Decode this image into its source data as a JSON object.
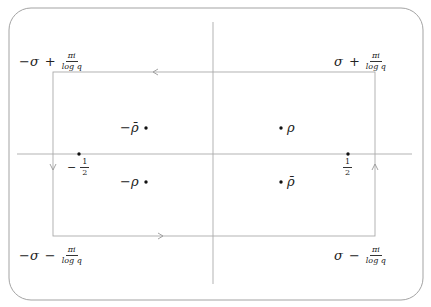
{
  "diagram": {
    "type": "contour-integral-rectangle",
    "colors": {
      "axis": "#aaaaaa",
      "contour": "#aaaaaa",
      "border": "#999999",
      "dot": "#111111",
      "text": "#222222"
    },
    "corners": {
      "top_left": {
        "sign": "−σ",
        "op": "+",
        "num": "πi",
        "den": "log q"
      },
      "top_right": {
        "sign": "σ",
        "op": "+",
        "num": "πi",
        "den": "log q"
      },
      "bottom_left": {
        "sign": "−σ",
        "op": "−",
        "num": "πi",
        "den": "log q"
      },
      "bottom_right": {
        "sign": "σ",
        "op": "−",
        "num": "πi",
        "den": "log q"
      }
    },
    "points": {
      "neg_rho_bar": "−ρ̄",
      "neg_rho": "−ρ",
      "rho": "ρ",
      "rho_bar": "ρ̄"
    },
    "axis_marks": {
      "neg_half": {
        "sign": "−",
        "num": "1",
        "den": "2"
      },
      "pos_half": {
        "num": "1",
        "den": "2"
      }
    }
  }
}
